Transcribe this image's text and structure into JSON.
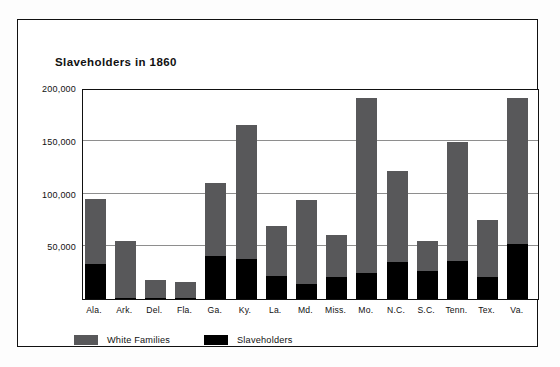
{
  "figure": {
    "title": "Slaveholders in 1860",
    "frame_color": "#111111",
    "background": "#ffffff"
  },
  "legend": {
    "position": "bottom-left",
    "entries": [
      {
        "label": "White Families",
        "color": "#58585a",
        "swatch_name": "white-families-swatch"
      },
      {
        "label": "Slaveholders",
        "color": "#000000",
        "swatch_name": "slaveholders-swatch"
      }
    ]
  },
  "axis": {
    "y_ticks": [
      "50,000",
      "100,000",
      "150,000",
      "200,000"
    ],
    "y_tick_values": [
      50000,
      100000,
      150000,
      200000
    ],
    "grid": true
  },
  "chart_data": {
    "type": "bar",
    "title": "Slaveholders in 1860",
    "xlabel": "",
    "ylabel": "",
    "ylim": [
      0,
      200000
    ],
    "yticks": [
      50000,
      100000,
      150000,
      200000
    ],
    "grid": true,
    "legend_position": "bottom-left",
    "stacked": true,
    "categories": [
      "Ala.",
      "Ark.",
      "Del.",
      "Fla.",
      "Ga.",
      "Ky.",
      "La.",
      "Md.",
      "Miss.",
      "Mo.",
      "N.C.",
      "S.C.",
      "Tenn.",
      "Tex.",
      "Va."
    ],
    "series": [
      {
        "name": "White Families",
        "color": "#58585a",
        "note": "bar height is the total white families; drawn as full bar",
        "values": [
          95000,
          55000,
          18000,
          16000,
          110000,
          165000,
          69000,
          94000,
          61000,
          191000,
          121000,
          55000,
          149000,
          75000,
          191000
        ]
      },
      {
        "name": "Slaveholders",
        "color": "#000000",
        "note": "black segment at base of each bar",
        "values": [
          33000,
          1000,
          600,
          500,
          41000,
          38000,
          22000,
          14000,
          21000,
          25000,
          35000,
          27000,
          36000,
          21000,
          52000
        ]
      }
    ]
  }
}
